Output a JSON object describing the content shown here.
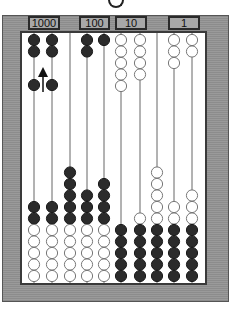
{
  "diagram": {
    "labels": [
      {
        "text": "1000",
        "column_span": [
          1,
          2
        ]
      },
      {
        "text": "100",
        "column_span": [
          4,
          5
        ]
      },
      {
        "text": "10",
        "column_span": [
          6,
          7
        ]
      },
      {
        "text": "1",
        "column_span": [
          9,
          10
        ]
      }
    ],
    "colors": {
      "frame": "#909090",
      "dark_bead": "#2b2b2b",
      "light_bead": "#ffffff",
      "rod": "#666666"
    },
    "columns": [
      {
        "top": [
          "dark",
          "dark"
        ],
        "middle": [
          "dark"
        ],
        "bottom": [
          "dark",
          "dark",
          "light",
          "light",
          "light",
          "light",
          "light"
        ]
      },
      {
        "top": [
          "dark",
          "dark"
        ],
        "middle": [
          "dark"
        ],
        "bottom": [
          "dark",
          "dark",
          "light",
          "light",
          "light",
          "light",
          "light"
        ]
      },
      {
        "top": [],
        "middle": [],
        "bottom": [
          "dark",
          "dark",
          "dark",
          "dark",
          "dark",
          "light",
          "light",
          "light",
          "light",
          "light"
        ]
      },
      {
        "top": [
          "dark",
          "dark"
        ],
        "middle": [],
        "bottom": [
          "dark",
          "dark",
          "dark",
          "light",
          "light",
          "light",
          "light",
          "light"
        ]
      },
      {
        "top": [
          "dark"
        ],
        "middle": [],
        "bottom": [
          "dark",
          "dark",
          "dark",
          "dark",
          "light",
          "light",
          "light",
          "light",
          "light"
        ]
      },
      {
        "top": [
          "light",
          "light",
          "light",
          "light",
          "light"
        ],
        "middle": [],
        "bottom": [
          "dark",
          "dark",
          "dark",
          "dark",
          "dark"
        ]
      },
      {
        "top": [
          "light",
          "light",
          "light",
          "light"
        ],
        "middle": [],
        "bottom": [
          "light",
          "dark",
          "dark",
          "dark",
          "dark",
          "dark"
        ]
      },
      {
        "top": [],
        "middle": [],
        "bottom": [
          "light",
          "light",
          "light",
          "light",
          "light",
          "dark",
          "dark",
          "dark",
          "dark",
          "dark"
        ]
      },
      {
        "top": [
          "light",
          "light",
          "light"
        ],
        "middle": [],
        "bottom": [
          "light",
          "light",
          "dark",
          "dark",
          "dark",
          "dark",
          "dark"
        ]
      },
      {
        "top": [
          "light",
          "light"
        ],
        "middle": [],
        "bottom": [
          "light",
          "light",
          "light",
          "dark",
          "dark",
          "dark",
          "dark",
          "dark"
        ]
      }
    ],
    "annotation": {
      "type": "arrow-up",
      "between_columns": [
        1,
        2
      ]
    }
  }
}
